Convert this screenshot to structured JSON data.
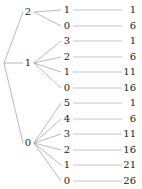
{
  "diagram": {
    "type": "tree",
    "root": {
      "label": "",
      "x": 4,
      "y": 63
    },
    "edge_color": "#8c8c8c",
    "connector_color": "#9a9a9a",
    "text_color": "#1a1a1a",
    "background_color": "#ffffff",
    "branches": [
      {
        "label": "2",
        "x": 28,
        "y": 12,
        "leaves": [
          {
            "key": "1",
            "value": "1",
            "y": 10
          },
          {
            "key": "0",
            "value": "6",
            "y": 26
          }
        ]
      },
      {
        "label": "1",
        "x": 28,
        "y": 63,
        "leaves": [
          {
            "key": "3",
            "value": "1",
            "y": 41
          },
          {
            "key": "2",
            "value": "6",
            "y": 57
          },
          {
            "key": "1",
            "value": "11",
            "y": 72
          },
          {
            "key": "0",
            "value": "16",
            "y": 88
          }
        ]
      },
      {
        "label": "0",
        "x": 28,
        "y": 143,
        "leaves": [
          {
            "key": "5",
            "value": "1",
            "y": 103
          },
          {
            "key": "4",
            "value": "6",
            "y": 119
          },
          {
            "key": "3",
            "value": "11",
            "y": 134
          },
          {
            "key": "2",
            "value": "16",
            "y": 150
          },
          {
            "key": "1",
            "value": "21",
            "y": 165
          },
          {
            "key": "0",
            "value": "26",
            "y": 181
          }
        ]
      }
    ],
    "layout": {
      "leaf_key_x": 67,
      "leaf_value_right_x": 136,
      "connector_start_x": 73,
      "connector_end_x": 122,
      "branch_node_right_x": 34,
      "leaf_node_left_x": 61
    }
  }
}
